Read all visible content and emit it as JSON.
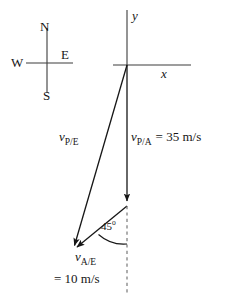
{
  "figure": {
    "background_color": "#ffffff",
    "stroke_color": "#161616"
  },
  "compass": {
    "name": "compass-rose",
    "north": "N",
    "south": "S",
    "west": "W",
    "east": "E"
  },
  "axes": {
    "y_label": "y",
    "x_label": "x"
  },
  "vectors": {
    "plane_relative_air": {
      "symbol": "v",
      "subscript": "P/A",
      "equals": "= 35 m/s",
      "magnitude": 35,
      "units": "m/s",
      "direction": "straight down (south)"
    },
    "plane_relative_earth": {
      "symbol": "v",
      "subscript": "P/E",
      "equals": "",
      "direction": "down and to the left (southwest)"
    },
    "air_relative_earth": {
      "symbol": "v",
      "subscript": "A/E",
      "equals": "= 10 m/s",
      "magnitude": 10,
      "units": "m/s",
      "direction": "down and to the left at 45 degrees from vertical"
    }
  },
  "annotations": {
    "angle": {
      "value": "45",
      "degree_symbol": "o",
      "text": "45o"
    }
  }
}
